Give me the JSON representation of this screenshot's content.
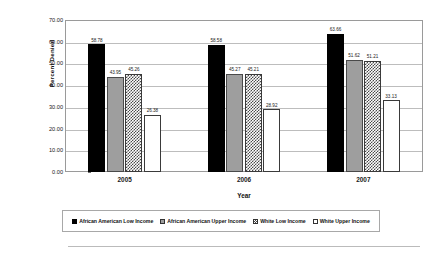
{
  "chart_data": {
    "type": "bar",
    "title": "",
    "xlabel": "Year",
    "ylabel": "Percent Denied",
    "categories": [
      "2005",
      "2006",
      "2007"
    ],
    "ylim": [
      0,
      70
    ],
    "yticks": [
      "0.00",
      "10.00",
      "20.00",
      "30.00",
      "40.00",
      "50.00",
      "60.00",
      "70.00"
    ],
    "ytick_values": [
      0,
      10,
      20,
      30,
      40,
      50,
      60,
      70
    ],
    "grid": true,
    "legend_position": "bottom",
    "series": [
      {
        "name": "African American Low Income",
        "fill": "fill-black",
        "color": "#000000",
        "values": [
          58.78,
          58.58,
          63.66
        ],
        "labels": [
          "58.78",
          "58.58",
          "63.66"
        ]
      },
      {
        "name": "African American Upper Income",
        "fill": "fill-gray",
        "color": "#9e9e9e",
        "values": [
          43.95,
          45.27,
          51.62
        ],
        "labels": [
          "43.95",
          "45.27",
          "51.62"
        ]
      },
      {
        "name": "White Low Income",
        "fill": "fill-hatch",
        "color": "#4a4a4a",
        "values": [
          45.26,
          45.21,
          51.21
        ],
        "labels": [
          "45.26",
          "45.21",
          "51.21"
        ]
      },
      {
        "name": "White Upper Income",
        "fill": "fill-white",
        "color": "#ffffff",
        "values": [
          26.38,
          28.92,
          33.13
        ],
        "labels": [
          "26.38",
          "28.92",
          "33.13"
        ]
      }
    ]
  },
  "caption": {
    "text": ""
  }
}
